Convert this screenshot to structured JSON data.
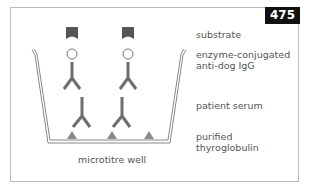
{
  "figure": {
    "number": "475",
    "labels": {
      "substrate": "substrate",
      "enzyme_line1": "enzyme-conjugated",
      "enzyme_line2": "anti-dog IgG",
      "patient_serum": "patient serum",
      "purified_line1": "purified",
      "purified_line2": "thyroglobulin",
      "well": "microtitre well"
    },
    "colors": {
      "molecule": "#707070",
      "substrate": "#555555",
      "antigen": "#8a8a8a",
      "badge_bg": "#111111"
    }
  }
}
